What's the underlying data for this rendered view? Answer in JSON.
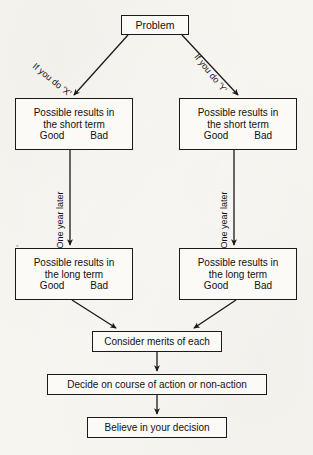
{
  "diagram": {
    "background_color": "#f7f5f0",
    "line_color": "#1a1a1a",
    "text_color": "#111111"
  },
  "nodes": {
    "problem": {
      "label": "Problem"
    },
    "short_x": {
      "line1": "Possible results in",
      "line2": "the short term",
      "good": "Good",
      "bad": "Bad"
    },
    "short_y": {
      "line1": "Possible results in",
      "line2": "the short term",
      "good": "Good",
      "bad": "Bad"
    },
    "long_x": {
      "line1": "Possible results in",
      "line2": "the long term",
      "good": "Good",
      "bad": "Bad"
    },
    "long_y": {
      "line1": "Possible results in",
      "line2": "the long term",
      "good": "Good",
      "bad": "Bad"
    },
    "consider": {
      "label": "Consider merits of each"
    },
    "decide": {
      "label": "Decide on course of action or non-action"
    },
    "believe": {
      "label": "Believe in your decision"
    }
  },
  "edge_labels": {
    "if_x": "If you do 'X'",
    "if_y": "If you do 'Y'",
    "one_year_later_x": "One year later",
    "one_year_later_y": "One year later"
  }
}
